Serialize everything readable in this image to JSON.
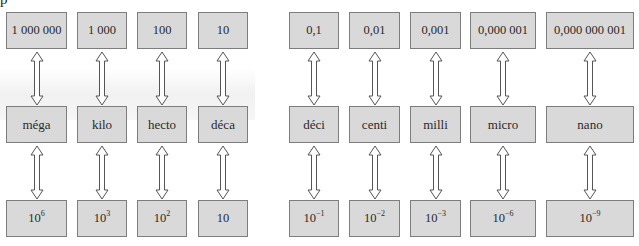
{
  "diagram": {
    "top_cut_text": "p",
    "colors": {
      "box_fill": "#d9d9d9",
      "box_border": "#7d7d7d",
      "arrow_stroke": "#555555"
    },
    "columns": [
      {
        "value": "1 000 000",
        "prefix": "méga",
        "power_base": "10",
        "power_exp": "6",
        "x": 6,
        "w": 61
      },
      {
        "value": "1 000",
        "prefix": "kilo",
        "power_base": "10",
        "power_exp": "3",
        "x": 77,
        "w": 50
      },
      {
        "value": "100",
        "prefix": "hecto",
        "power_base": "10",
        "power_exp": "2",
        "x": 137,
        "w": 50
      },
      {
        "value": "10",
        "prefix": "déca",
        "power_base": "10",
        "power_exp": "",
        "x": 198,
        "w": 50
      },
      {
        "value": "0,1",
        "prefix": "déci",
        "power_base": "10",
        "power_exp": "−1",
        "x": 289,
        "w": 50
      },
      {
        "value": "0,01",
        "prefix": "centi",
        "power_base": "10",
        "power_exp": "−2",
        "x": 349,
        "w": 51
      },
      {
        "value": "0,001",
        "prefix": "milli",
        "power_base": "10",
        "power_exp": "−3",
        "x": 410,
        "w": 51
      },
      {
        "value": "0,000 001",
        "prefix": "micro",
        "power_base": "10",
        "power_exp": "−6",
        "x": 470,
        "w": 66
      },
      {
        "value": "0,000 000 001",
        "prefix": "nano",
        "power_base": "10",
        "power_exp": "−9",
        "x": 546,
        "w": 88
      }
    ]
  }
}
